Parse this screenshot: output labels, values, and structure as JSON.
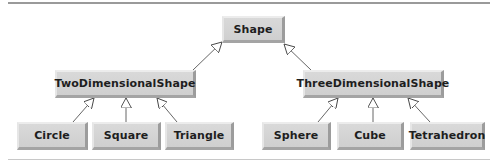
{
  "diagram": {
    "type": "uml-class-hierarchy",
    "root": {
      "label": "Shape"
    },
    "level1": [
      {
        "label": "TwoDimensionalShape"
      },
      {
        "label": "ThreeDimensionalShape"
      }
    ],
    "level2": [
      {
        "label": "Circle",
        "parent": "TwoDimensionalShape"
      },
      {
        "label": "Square",
        "parent": "TwoDimensionalShape"
      },
      {
        "label": "Triangle",
        "parent": "TwoDimensionalShape"
      },
      {
        "label": "Sphere",
        "parent": "ThreeDimensionalShape"
      },
      {
        "label": "Cube",
        "parent": "ThreeDimensionalShape"
      },
      {
        "label": "Tetrahedron",
        "parent": "ThreeDimensionalShape"
      }
    ],
    "edges": [
      {
        "from": "TwoDimensionalShape",
        "to": "Shape",
        "kind": "generalization"
      },
      {
        "from": "ThreeDimensionalShape",
        "to": "Shape",
        "kind": "generalization"
      },
      {
        "from": "Circle",
        "to": "TwoDimensionalShape",
        "kind": "generalization"
      },
      {
        "from": "Square",
        "to": "TwoDimensionalShape",
        "kind": "generalization"
      },
      {
        "from": "Triangle",
        "to": "TwoDimensionalShape",
        "kind": "generalization"
      },
      {
        "from": "Sphere",
        "to": "ThreeDimensionalShape",
        "kind": "generalization"
      },
      {
        "from": "Cube",
        "to": "ThreeDimensionalShape",
        "kind": "generalization"
      },
      {
        "from": "Tetrahedron",
        "to": "ThreeDimensionalShape",
        "kind": "generalization"
      }
    ],
    "colors": {
      "box_fill": "#d4d4d4",
      "box_shadow": "#9c9c9c",
      "line": "#555555",
      "rule": "#9a9a9a"
    }
  }
}
